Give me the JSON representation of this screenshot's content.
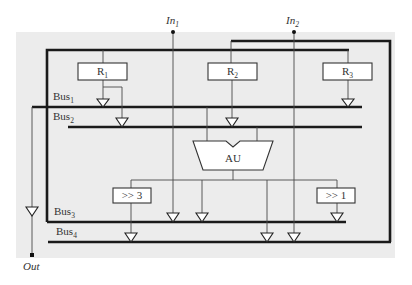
{
  "diagram": {
    "inputs": [
      {
        "name": "In",
        "sub": "1"
      },
      {
        "name": "In",
        "sub": "2"
      }
    ],
    "output": {
      "name": "Out"
    },
    "registers": [
      {
        "name": "R",
        "sub": "1"
      },
      {
        "name": "R",
        "sub": "2"
      },
      {
        "name": "R",
        "sub": "3"
      }
    ],
    "buses": [
      {
        "name": "Bus",
        "sub": "1"
      },
      {
        "name": "Bus",
        "sub": "2"
      },
      {
        "name": "Bus",
        "sub": "3"
      },
      {
        "name": "Bus",
        "sub": "4"
      }
    ],
    "arithmetic_unit": {
      "label": "AU"
    },
    "shifters": [
      {
        "label": ">> 3"
      },
      {
        "label": ">> 1"
      }
    ],
    "colors": {
      "panel": "#ececec",
      "wire": "#1a1a1a",
      "box": "#ffffff"
    }
  }
}
